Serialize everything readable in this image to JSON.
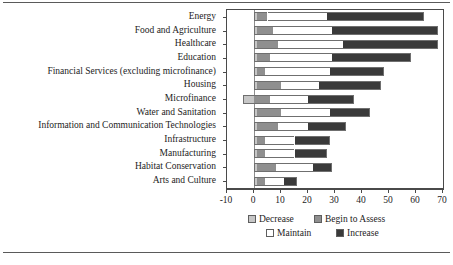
{
  "chart_data": {
    "type": "bar",
    "orientation": "horizontal",
    "stacked": true,
    "title": "",
    "xlabel": "",
    "ylabel": "",
    "xlim": [
      -10,
      70
    ],
    "grid": false,
    "legend_position": "bottom",
    "xticks": [
      "-10",
      "0",
      "10",
      "20",
      "30",
      "40",
      "50",
      "60",
      "70"
    ],
    "xtick_values": [
      -10,
      0,
      10,
      20,
      30,
      40,
      50,
      60,
      70
    ],
    "categories": [
      "Energy",
      "Food and Agriculture",
      "Healthcare",
      "Education",
      "Financial Services (excluding microfinance)",
      "Housing",
      "Microfinance",
      "Water and Sanitation",
      "Information and Communication Technologies",
      "Infrastructure",
      "Manufacturing",
      "Habitat Conservation",
      "Arts and Culture"
    ],
    "series": [
      {
        "name": "Decrease",
        "color": "#c6c6c6",
        "values": [
          1,
          1,
          1,
          1,
          1,
          1,
          -4,
          1,
          1,
          1,
          1,
          1,
          1
        ]
      },
      {
        "name": "Begin to Assess",
        "color": "#8f8f8f",
        "values": [
          4,
          6,
          8,
          5,
          3,
          9,
          6,
          9,
          8,
          3,
          3,
          7,
          3
        ]
      },
      {
        "name": "Maintain",
        "color": "#ffffff",
        "values": [
          22,
          22,
          24,
          23,
          24,
          14,
          14,
          18,
          11,
          11,
          11,
          14,
          7
        ]
      },
      {
        "name": "Increase",
        "color": "#3a3a3a",
        "values": [
          36,
          39,
          35,
          29,
          20,
          23,
          17,
          15,
          14,
          13,
          12,
          7,
          5
        ]
      }
    ],
    "totals": [
      63,
      68,
      68,
      58,
      48,
      47,
      33,
      43,
      34,
      28,
      27,
      29,
      16
    ],
    "legend": [
      {
        "label": "Decrease",
        "color": "#c6c6c6"
      },
      {
        "label": "Begin to Assess",
        "color": "#8f8f8f"
      },
      {
        "label": "Maintain",
        "color": "#ffffff"
      },
      {
        "label": "Increase",
        "color": "#3a3a3a"
      }
    ]
  }
}
